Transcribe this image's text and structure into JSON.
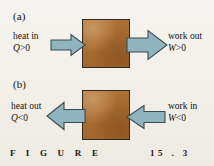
{
  "figure": {
    "caption_word": "F I G U R E",
    "caption_number": "15 . 3",
    "box_color": "#a96c31",
    "box_border_color": "#2e2a24",
    "arrow_fill_color": "#8fb3bf",
    "arrow_stroke_color": "#3f4a4e",
    "background_color": "#f4f2ee",
    "text_color": "#15120e"
  },
  "panels": [
    {
      "key": "a",
      "label": "(a)",
      "left_flow": {
        "name": "heat in",
        "text": "heat in",
        "equation_symbol": "Q",
        "equation_operator": ">",
        "equation_value": "0",
        "equation": "Q > 0",
        "direction": "right",
        "meaning": "heat flows into the system"
      },
      "right_flow": {
        "name": "work out",
        "text": "work out",
        "equation_symbol": "W",
        "equation_operator": ">",
        "equation_value": "0",
        "equation": "W > 0",
        "direction": "right",
        "meaning": "work done by the system"
      },
      "system_label": "system"
    },
    {
      "key": "b",
      "label": "(b)",
      "left_flow": {
        "name": "heat out",
        "text": "heat out",
        "equation_symbol": "Q",
        "equation_operator": "<",
        "equation_value": "0",
        "equation": "Q < 0",
        "direction": "left",
        "meaning": "heat flows out of the system"
      },
      "right_flow": {
        "name": "work in",
        "text": "work in",
        "equation_symbol": "W",
        "equation_operator": "<",
        "equation_value": "0",
        "equation": "W < 0",
        "direction": "left",
        "meaning": "work done on the system"
      },
      "system_label": "system"
    }
  ]
}
